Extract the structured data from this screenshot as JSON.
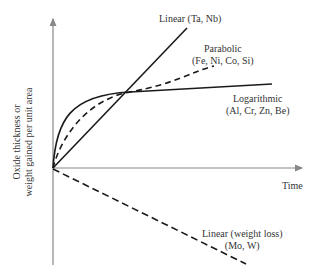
{
  "diagram": {
    "axes": {
      "y_label_line1": "Oxide thickness or",
      "y_label_line2": "weight gained per unit area",
      "x_label": "Time"
    },
    "curves": [
      {
        "name": "Linear",
        "line1": "Linear (Ta, Nb)",
        "style": "solid"
      },
      {
        "name": "Parabolic",
        "line1": "Parabolic",
        "line2": "(Fe, Ni, Co, Si)",
        "style": "dashed"
      },
      {
        "name": "Logarithmic",
        "line1": "Logarithmic",
        "line2": "(Al, Cr, Zn, Be)",
        "style": "solid"
      },
      {
        "name": "Linear weight loss",
        "line1": "Linear (weight loss)",
        "line2": "(Mo, W)",
        "style": "dashed"
      }
    ],
    "colors": {
      "axis": "#888888",
      "curve": "#1a1a1a"
    }
  }
}
